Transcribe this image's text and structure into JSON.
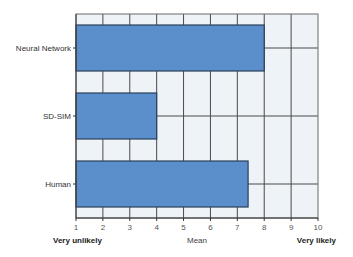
{
  "chart_data": {
    "type": "bar",
    "orientation": "horizontal",
    "title": "",
    "categories": [
      "Neural Network",
      "SD-SIM",
      "Human"
    ],
    "values": [
      8.0,
      4.0,
      7.4
    ],
    "xlabel": "Mean",
    "ylabel": "",
    "xlim": [
      1,
      10
    ],
    "x_ticks": [
      "1",
      "2",
      "3",
      "4",
      "5",
      "6",
      "7",
      "8",
      "9",
      "10"
    ],
    "x_anchor_left": "Very unlikely",
    "x_anchor_right": "Very likely",
    "grid": true,
    "legend": null,
    "colors": {
      "bar_fill": "#5b8fcb",
      "bar_stroke": "#2a3f5a",
      "plot_background": "#eef3f7",
      "grid": "#4a4a4a"
    }
  }
}
